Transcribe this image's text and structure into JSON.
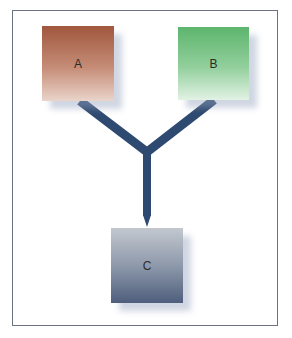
{
  "diagram": {
    "type": "merge-flow",
    "nodes": [
      {
        "id": "A",
        "label": "A",
        "color_top": "#a0573d",
        "color_bottom": "#ead4cb"
      },
      {
        "id": "B",
        "label": "B",
        "color_top": "#5db56d",
        "color_bottom": "#e2f2e4"
      },
      {
        "id": "C",
        "label": "C",
        "color_top": "#c3c8cf",
        "color_bottom": "#4e5e7c"
      }
    ],
    "edges": [
      {
        "from": "A",
        "to": "C"
      },
      {
        "from": "B",
        "to": "C"
      }
    ],
    "connector_color": "#2e4a70",
    "frame_color": "#6b7280"
  }
}
